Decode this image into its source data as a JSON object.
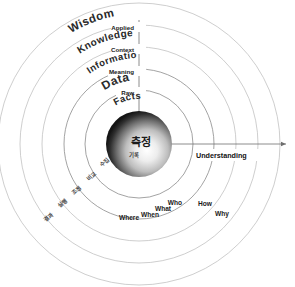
{
  "diagram": {
    "center": {
      "x": 139,
      "y": 144
    },
    "core": {
      "label_main": "측정",
      "label_sub": "기록",
      "radius": 33,
      "gradient_dark": "#1e1e1e",
      "gradient_light": "#f2f2f2"
    },
    "vertical_axis": {
      "tick_labels": [
        "Applied",
        "Context",
        "Meaning",
        "Raw"
      ],
      "tick_radii": [
        119,
        97,
        75,
        54
      ]
    },
    "horizontal_axis": {
      "name": "Understanding",
      "arrow": "right-arrow-icon"
    },
    "tiers": [
      {
        "label": "Facts",
        "radius": 45,
        "font_size": 9.5
      },
      {
        "label": "Data",
        "radius": 64,
        "font_size": 12
      },
      {
        "label": "Information",
        "radius": 86,
        "font_size": 9.5
      },
      {
        "label": "Knowledge",
        "radius": 108,
        "font_size": 10
      },
      {
        "label": "Wisdom",
        "radius": 130,
        "font_size": 11.5
      }
    ],
    "rings": [
      54,
      75,
      97,
      119,
      141
    ],
    "question_labels": [
      {
        "text": "Who",
        "x": 175,
        "y": 205
      },
      {
        "text": "How",
        "x": 205,
        "y": 206
      },
      {
        "text": "What",
        "x": 163,
        "y": 211
      },
      {
        "text": "When",
        "x": 150,
        "y": 217
      },
      {
        "text": "Where",
        "x": 129,
        "y": 220
      },
      {
        "text": "Why",
        "x": 222,
        "y": 216
      }
    ],
    "korean_labels": [
      {
        "text": "수집",
        "x": 106,
        "y": 164,
        "rotate": -44
      },
      {
        "text": "비교",
        "x": 93,
        "y": 178,
        "rotate": -44
      },
      {
        "text": "조정",
        "x": 78,
        "y": 192,
        "rotate": -44
      },
      {
        "text": "실행",
        "x": 64,
        "y": 205,
        "rotate": -44
      },
      {
        "text": "결과",
        "x": 50,
        "y": 219,
        "rotate": -44
      }
    ],
    "colors": {
      "background": "#ffffff",
      "ring_stroke": "#b9b9b9",
      "axis_stroke": "#6e6e6e",
      "text": "#1a1a1a"
    }
  }
}
